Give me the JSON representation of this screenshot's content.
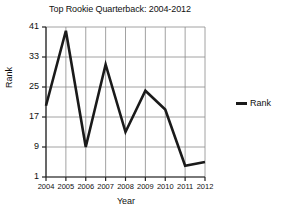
{
  "chart_data": {
    "type": "line",
    "title": "Top Rookie Quarterback: 2004-2012",
    "xlabel": "Year",
    "ylabel": "Rank",
    "categories": [
      "2004",
      "2005",
      "2006",
      "2007",
      "2008",
      "2009",
      "2010",
      "2011",
      "2012"
    ],
    "series": [
      {
        "name": "Rank",
        "values": [
          20,
          40,
          9,
          31,
          13,
          24,
          19,
          4,
          5
        ],
        "color": "#1a1a1a"
      }
    ],
    "ylim": [
      1,
      41
    ],
    "yticks": [
      1,
      9,
      17,
      25,
      33,
      41
    ],
    "ytick_labels": [
      "1",
      "9",
      "17",
      "25",
      "33",
      "41"
    ],
    "xtick_labels": [
      "2004",
      "2005",
      "2006",
      "2007",
      "2008",
      "2009",
      "2010",
      "2011",
      "2012"
    ],
    "grid": true,
    "grid_color": "#8a8a8a",
    "legend": {
      "position": "right",
      "entries": [
        {
          "label": "Rank",
          "marker": "line-swatch",
          "color": "#1a1a1a"
        }
      ]
    }
  }
}
